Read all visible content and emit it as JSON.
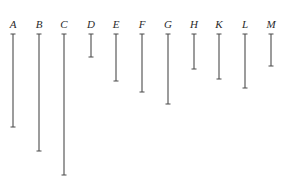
{
  "diagram": {
    "segments": [
      {
        "label": "A",
        "length": 93
      },
      {
        "label": "B",
        "length": 117
      },
      {
        "label": "C",
        "length": 141
      },
      {
        "label": "D",
        "length": 23
      },
      {
        "label": "E",
        "length": 47
      },
      {
        "label": "F",
        "length": 58
      },
      {
        "label": "G",
        "length": 70
      },
      {
        "label": "H",
        "length": 35
      },
      {
        "label": "K",
        "length": 45
      },
      {
        "label": "L",
        "length": 54
      },
      {
        "label": "M",
        "length": 32
      }
    ],
    "colors": {
      "line": "#5a5a5a",
      "label": "#2a2a2a",
      "background": "#ffffff"
    }
  }
}
